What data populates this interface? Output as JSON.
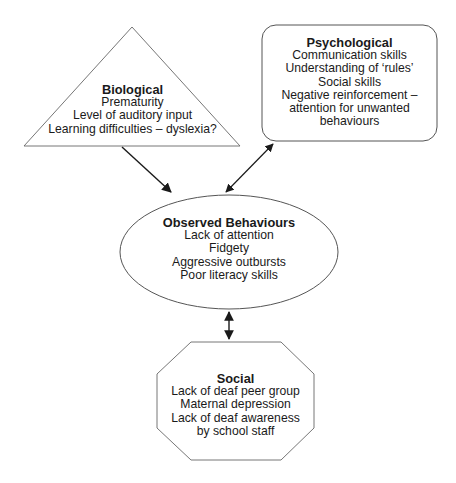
{
  "diagram": {
    "colors": {
      "stroke": "#555555",
      "arrow": "#1a1a1a",
      "text": "#1a1a1a",
      "background": "#ffffff"
    },
    "nodes": {
      "biological": {
        "shape": "triangle",
        "title": "Biological",
        "lines": [
          "Prematurity",
          "Level of auditory input",
          "Learning difficulties – dyslexia?"
        ]
      },
      "psychological": {
        "shape": "rounded-rectangle",
        "title": "Psychological",
        "lines": [
          "Communication skills",
          "Understanding of ‘rules’",
          "Social skills",
          "Negative reinforcement –",
          "attention for unwanted",
          "behaviours"
        ]
      },
      "observed": {
        "shape": "ellipse",
        "title": "Observed Behaviours",
        "lines": [
          "Lack of attention",
          "Fidgety",
          "Aggressive outbursts",
          "Poor literacy skills"
        ]
      },
      "social": {
        "shape": "octagon",
        "title": "Social",
        "lines": [
          "Lack of deaf peer group",
          "Maternal depression",
          "Lack of deaf awareness",
          "by school staff"
        ]
      }
    },
    "edges": [
      {
        "from": "biological",
        "to": "observed",
        "direction": "one-way"
      },
      {
        "from": "psychological",
        "to": "observed",
        "direction": "two-way"
      },
      {
        "from": "observed",
        "to": "social",
        "direction": "two-way"
      }
    ]
  }
}
